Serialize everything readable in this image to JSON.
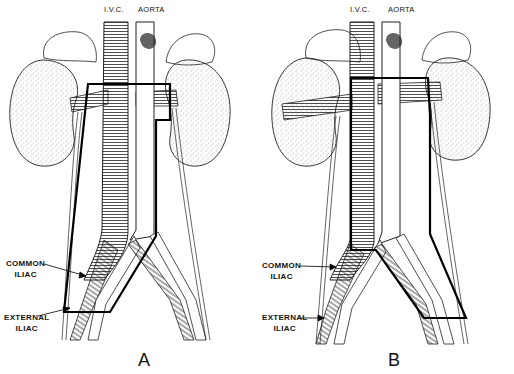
{
  "figure": {
    "panels": [
      {
        "id": "A",
        "letter": "A",
        "labels": {
          "ivc": "I.V.C.",
          "aorta": "AORTA",
          "common_iliac_line1": "COMMON",
          "common_iliac_line2": "ILIAC",
          "external_iliac_line1": "EXTERNAL",
          "external_iliac_line2": "ILIAC"
        }
      },
      {
        "id": "B",
        "letter": "B",
        "labels": {
          "ivc": "I.V.C.",
          "aorta": "AORTA",
          "common_iliac_line1": "COMMON",
          "common_iliac_line2": "ILIAC",
          "external_iliac_line1": "EXTERNAL",
          "external_iliac_line2": "ILIAC"
        }
      }
    ],
    "colors": {
      "ink": "#111111",
      "background": "#ffffff",
      "stipple": "#888888"
    }
  }
}
